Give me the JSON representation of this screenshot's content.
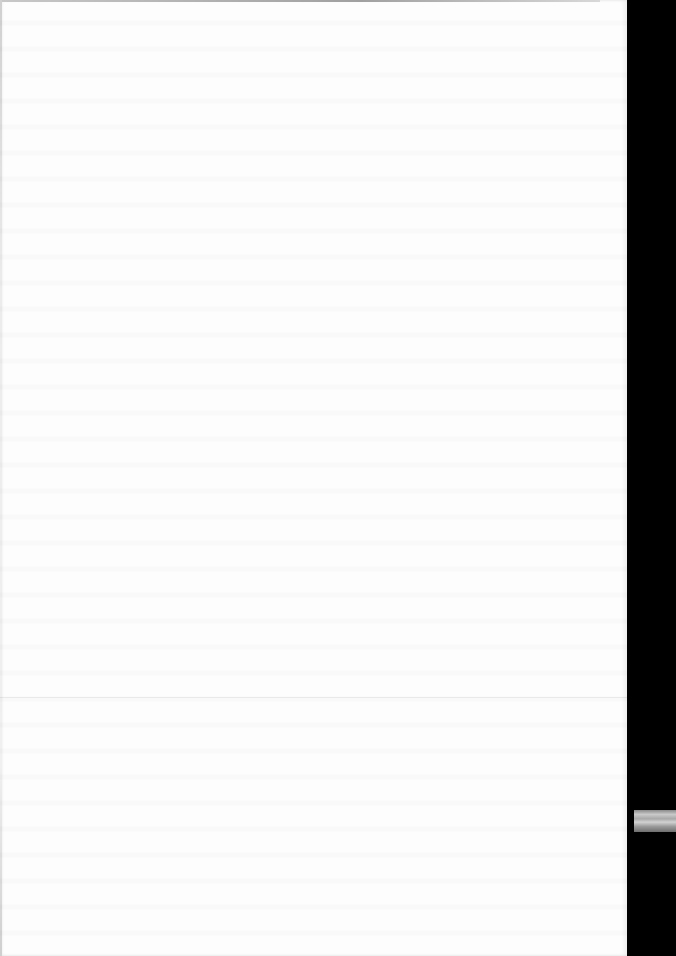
{
  "document": {
    "type": "scanned-page",
    "content": "",
    "visible_text": []
  },
  "colors": {
    "paper": "#fdfdfd",
    "background": "#000000",
    "edge_tab": "#a8a8a8"
  }
}
